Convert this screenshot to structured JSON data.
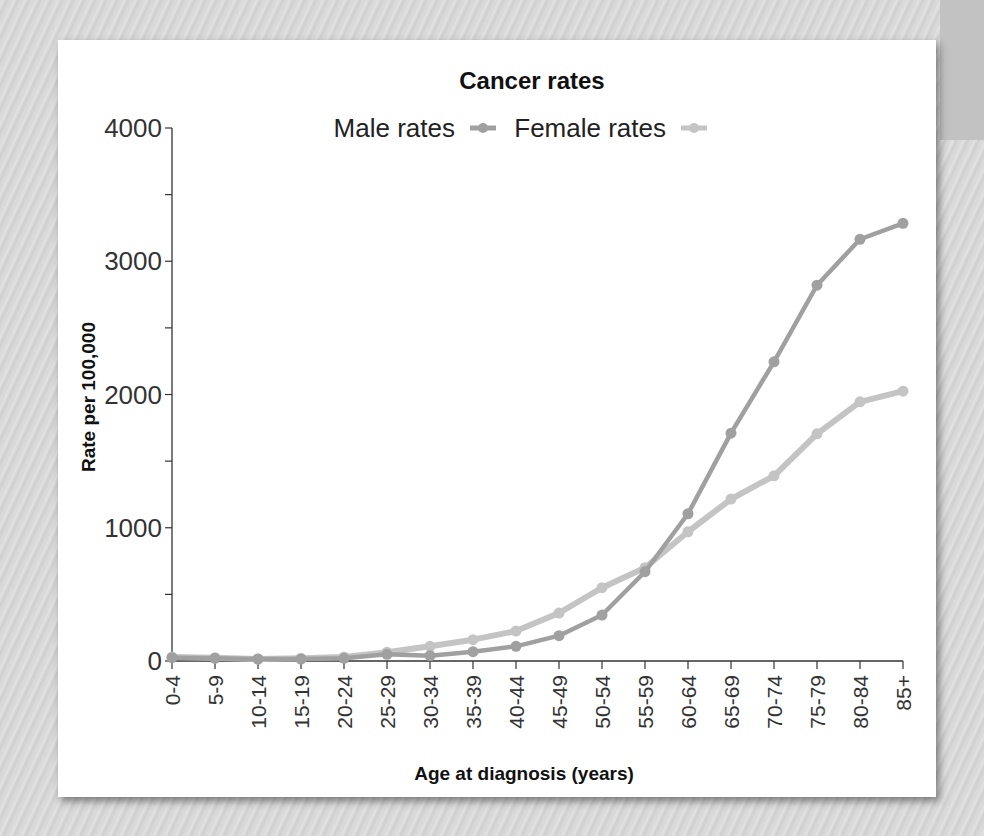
{
  "chart_data": {
    "type": "line",
    "title": "Cancer rates",
    "xlabel": "Age at diagnosis (years)",
    "ylabel": "Rate per 100,000",
    "ylim": [
      0,
      4000
    ],
    "yticks": [
      0,
      1000,
      2000,
      3000,
      4000
    ],
    "grid": false,
    "legend_position": "top",
    "categories": [
      "0-4",
      "5-9",
      "10-14",
      "15-19",
      "20-24",
      "25-29",
      "30-34",
      "35-39",
      "40-44",
      "45-49",
      "50-54",
      "55-59",
      "60-64",
      "65-69",
      "70-74",
      "75-79",
      "80-84",
      "85+"
    ],
    "series": [
      {
        "name": "Male rates",
        "color": "#a0a0a0",
        "values": [
          25,
          20,
          15,
          15,
          20,
          50,
          40,
          70,
          110,
          190,
          345,
          670,
          1105,
          1710,
          2245,
          2820,
          3165,
          3285
        ]
      },
      {
        "name": "Female rates",
        "color": "#c4c4c4",
        "values": [
          30,
          25,
          15,
          20,
          30,
          65,
          110,
          160,
          225,
          360,
          550,
          700,
          970,
          1215,
          1390,
          1705,
          1945,
          2025
        ]
      }
    ]
  }
}
